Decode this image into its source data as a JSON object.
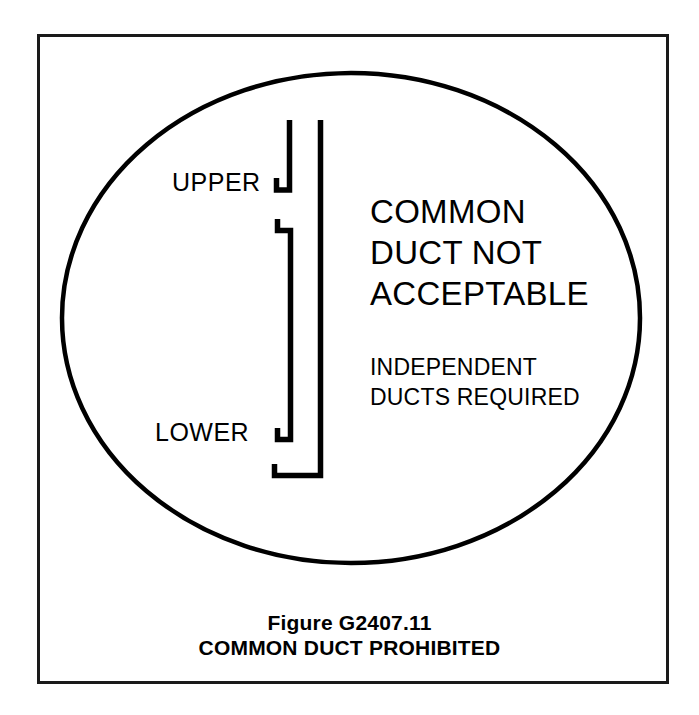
{
  "figure": {
    "frame": {
      "border_color": "#1a1a1a",
      "background_color": "#ffffff"
    },
    "ellipse": {
      "stroke_color": "#000000",
      "fill_color": "#ffffff"
    },
    "diagram": {
      "name": "common-duct-schematic",
      "stroke_color": "#000000",
      "labels": {
        "upper": "UPPER",
        "lower": "LOWER"
      }
    },
    "message": {
      "headline_lines": [
        "COMMON",
        "DUCT NOT",
        "ACCEPTABLE"
      ],
      "sub_lines": [
        "INDEPENDENT",
        "DUCTS REQUIRED"
      ]
    },
    "caption": {
      "figure_number": "Figure G2407.11",
      "title": "COMMON DUCT PROHIBITED"
    }
  }
}
